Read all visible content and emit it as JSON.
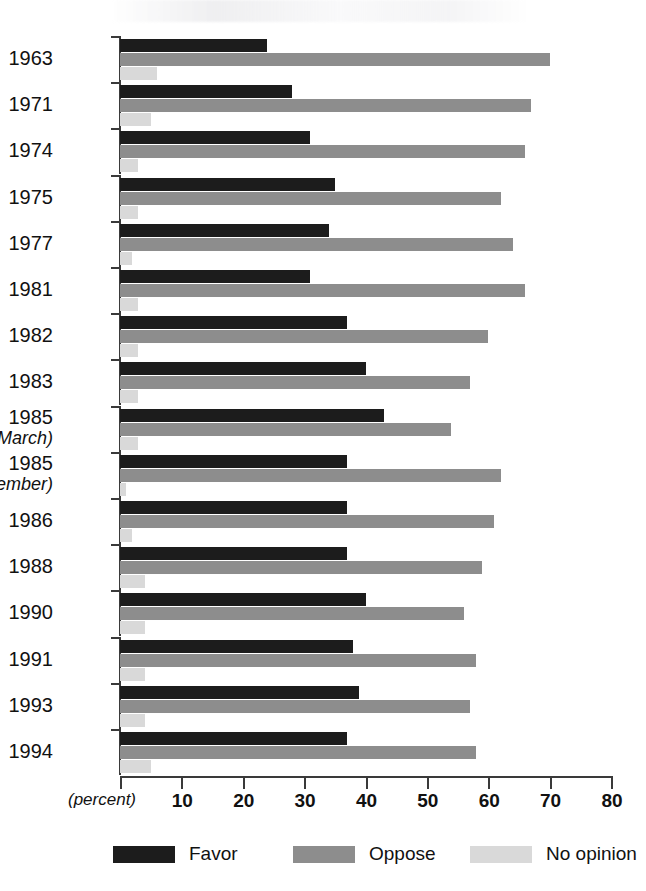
{
  "chart_data": {
    "type": "bar",
    "orientation": "horizontal",
    "title": "",
    "subtitle": "",
    "xlabel": "(percent)",
    "ylabel": "",
    "xlim": [
      0,
      80
    ],
    "xticks": [
      0,
      10,
      20,
      30,
      40,
      50,
      60,
      70,
      80
    ],
    "xtick_labels": [
      "",
      "10",
      "20",
      "30",
      "40",
      "50",
      "60",
      "70",
      "80"
    ],
    "grid": false,
    "legend_position": "bottom",
    "categories": [
      "1963",
      "1971",
      "1974",
      "1975",
      "1977",
      "1981",
      "1982",
      "1983",
      "1985 (March)",
      "1985 (September)",
      "1986",
      "1988",
      "1990",
      "1991",
      "1993",
      "1994"
    ],
    "category_labels": [
      {
        "year": "1963",
        "note": ""
      },
      {
        "year": "1971",
        "note": ""
      },
      {
        "year": "1974",
        "note": ""
      },
      {
        "year": "1975",
        "note": ""
      },
      {
        "year": "1977",
        "note": ""
      },
      {
        "year": "1981",
        "note": ""
      },
      {
        "year": "1982",
        "note": ""
      },
      {
        "year": "1983",
        "note": ""
      },
      {
        "year": "1985",
        "note": "(March)"
      },
      {
        "year": "1985",
        "note": "(September)"
      },
      {
        "year": "1986",
        "note": ""
      },
      {
        "year": "1988",
        "note": ""
      },
      {
        "year": "1990",
        "note": ""
      },
      {
        "year": "1991",
        "note": ""
      },
      {
        "year": "1993",
        "note": ""
      },
      {
        "year": "1994",
        "note": ""
      }
    ],
    "series": [
      {
        "name": "Favor",
        "color": "#1c1c1c",
        "values": [
          24,
          28,
          31,
          35,
          34,
          31,
          37,
          40,
          43,
          37,
          37,
          37,
          40,
          38,
          39,
          37
        ]
      },
      {
        "name": "Oppose",
        "color": "#8d8d8d",
        "values": [
          70,
          67,
          66,
          62,
          64,
          66,
          60,
          57,
          54,
          62,
          61,
          59,
          56,
          58,
          57,
          58
        ]
      },
      {
        "name": "No opinion",
        "color": "#d9d9d9",
        "values": [
          6,
          5,
          3,
          3,
          2,
          3,
          3,
          3,
          3,
          1,
          2,
          4,
          4,
          4,
          4,
          5
        ]
      }
    ]
  },
  "legend": {
    "items": [
      {
        "label": "Favor",
        "swatch_class": "sw-favor",
        "color": "#1c1c1c"
      },
      {
        "label": "Oppose",
        "swatch_class": "sw-oppose",
        "color": "#8d8d8d"
      },
      {
        "label": "No opinion",
        "swatch_class": "sw-noop",
        "color": "#d9d9d9"
      }
    ]
  },
  "axis": {
    "unit_caption": "(percent)"
  }
}
